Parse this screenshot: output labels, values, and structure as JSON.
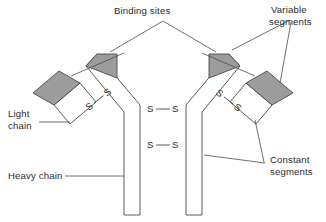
{
  "figure": {
    "background_color": "#ffffff",
    "line_color": "#4a4a4a",
    "variable_segment_fill": "#9c9c9c",
    "constant_segment_fill": "#ffffff"
  },
  "labels": {
    "binding_sites": "Binding sites",
    "variable_segments_line1": "Variable",
    "variable_segments_line2": "segments",
    "constant_segments_line1": "Constant",
    "constant_segments_line2": "segments",
    "light_chain_line1": "Light",
    "light_chain_line2": "chain",
    "heavy_chain": "Heavy chain"
  },
  "bonds": {
    "sulfur": "S",
    "center_upper": {
      "left": "S",
      "right": "S"
    },
    "center_lower": {
      "left": "S",
      "right": "S"
    },
    "left_arm": {
      "lower": "S",
      "upper": "S"
    },
    "right_arm": {
      "upper": "S",
      "lower": "S"
    }
  },
  "structure": {
    "chains": [
      {
        "name": "heavy-chain-left",
        "type": "heavy"
      },
      {
        "name": "heavy-chain-right",
        "type": "heavy"
      },
      {
        "name": "light-chain-left",
        "type": "light"
      },
      {
        "name": "light-chain-right",
        "type": "light"
      }
    ],
    "segment_counts": {
      "variable": 4,
      "constant": 4
    },
    "disulfide_bond_count": 4,
    "binding_site_count": 2
  }
}
